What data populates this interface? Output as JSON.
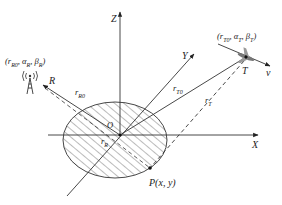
{
  "diagram": {
    "type": "bistatic-radar-geometry",
    "axes": {
      "x_label": "X",
      "y_label": "Y",
      "z_label": "Z",
      "origin_label": "O"
    },
    "receiver": {
      "label": "R",
      "coords_label": "(r_R0, α_R, β_R)",
      "coords_parts": {
        "r": "r",
        "r_sub": "R0",
        "a": "α",
        "a_sub": "R",
        "b": "β",
        "b_sub": "R"
      },
      "range_label": "r",
      "range_sub": "R0",
      "icon": "radio-tower-icon"
    },
    "transmitter": {
      "label": "T",
      "coords_label": "(r_T0, α_T, β_T)",
      "coords_parts": {
        "r": "r",
        "r_sub": "T0",
        "a": "α",
        "a_sub": "T",
        "b": "β",
        "b_sub": "T"
      },
      "range_label": "r",
      "range_sub": "T0",
      "icon": "aircraft-icon",
      "velocity_label": "v"
    },
    "target_point": {
      "label": "P(x, y)",
      "range_to_T_label": "r",
      "range_to_T_sub": "T",
      "range_to_R_label": "r",
      "range_to_R_sub": "R"
    },
    "region": {
      "shape": "ellipse",
      "fill": "hatched"
    },
    "colors": {
      "line": "#333333",
      "hatch": "#555555",
      "background": "#ffffff"
    }
  }
}
